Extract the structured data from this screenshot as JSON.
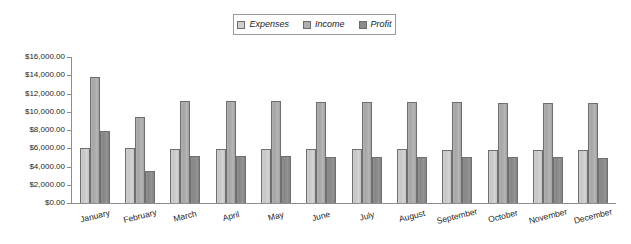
{
  "legend": {
    "position": "top-center",
    "items": [
      {
        "label": "Expenses",
        "color": "#c8c8c8",
        "icon": "legend-swatch-icon"
      },
      {
        "label": "Income",
        "color": "#a8a8a8",
        "icon": "legend-swatch-icon"
      },
      {
        "label": "Profit",
        "color": "#888888",
        "icon": "legend-swatch-icon"
      }
    ]
  },
  "axis": {
    "y_tick_labels": [
      "$16,000.00",
      "$14,000.00",
      "$12,000.00",
      "$10,000.00",
      "$8,000.00",
      "$6,000.00",
      "$4,000.00",
      "$2,000.00",
      "$0.00"
    ]
  },
  "chart_data": {
    "type": "bar",
    "title": "",
    "subtitle": "",
    "xlabel": "",
    "ylabel": "",
    "ylim": [
      0,
      16000
    ],
    "ytick_step": 2000,
    "grid": false,
    "legend_position": "top-center",
    "categories": [
      "January",
      "February",
      "March",
      "April",
      "May",
      "June",
      "July",
      "August",
      "September",
      "October",
      "November",
      "December"
    ],
    "series": [
      {
        "name": "Expenses",
        "color": "#c8c8c8",
        "values": [
          6020,
          6000,
          5960,
          5940,
          5910,
          5900,
          5890,
          5880,
          5860,
          5840,
          5820,
          5810
        ]
      },
      {
        "name": "Income",
        "color": "#a8a8a8",
        "values": [
          13780,
          9480,
          11160,
          11160,
          11140,
          11110,
          11080,
          11060,
          11050,
          11010,
          10980,
          10950
        ]
      },
      {
        "name": "Profit",
        "color": "#888888",
        "values": [
          7880,
          3480,
          5160,
          5120,
          5100,
          5090,
          5070,
          5050,
          5030,
          5010,
          4990,
          4980
        ]
      }
    ]
  }
}
